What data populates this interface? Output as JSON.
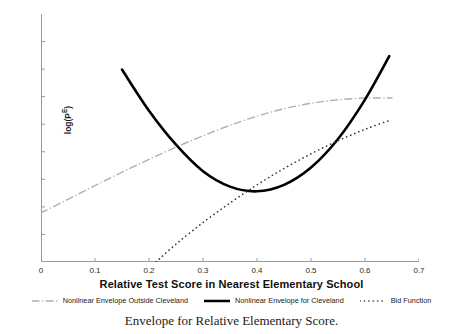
{
  "chart_data": {
    "type": "line",
    "title": "",
    "caption": "Envelope for Relative Elementary Score.",
    "xlabel": "Relative Test Score in Nearest Elementary School",
    "ylabel": "log(P",
    "ylabel_sup": "E",
    "ylabel_close": ")",
    "xlim": [
      0,
      0.7
    ],
    "ylim": [
      0,
      1
    ],
    "grid": false,
    "legend_position": "bottom",
    "xticks": [
      "0",
      "0.1",
      "0.2",
      "0.3",
      "0.4",
      "0.5",
      "0.6",
      "0.7"
    ],
    "xtick_values": [
      0,
      0.1,
      0.2,
      0.3,
      0.4,
      0.5,
      0.6,
      0.7
    ],
    "yticks": [],
    "ytick_count": 8,
    "series": [
      {
        "name": "Nonlinear Envelope Outside Cleveland",
        "style": "dashdot",
        "color": "#b0b0b0",
        "width": 1.4,
        "x": [
          0.0,
          0.05,
          0.1,
          0.15,
          0.2,
          0.25,
          0.3,
          0.35,
          0.4,
          0.45,
          0.5,
          0.55,
          0.6,
          0.65
        ],
        "y": [
          0.198,
          0.253,
          0.308,
          0.362,
          0.414,
          0.463,
          0.509,
          0.551,
          0.588,
          0.618,
          0.64,
          0.654,
          0.661,
          0.661
        ]
      },
      {
        "name": "Nonlinear Envelope for Cleveland",
        "style": "solid",
        "color": "#000000",
        "width": 2.6,
        "x": [
          0.15,
          0.2,
          0.25,
          0.3,
          0.35,
          0.4,
          0.45,
          0.5,
          0.55,
          0.6,
          0.645
        ],
        "y": [
          0.776,
          0.61,
          0.473,
          0.366,
          0.304,
          0.285,
          0.311,
          0.381,
          0.496,
          0.655,
          0.83
        ]
      },
      {
        "name": "Bid Function",
        "style": "dotted",
        "color": "#3a3a3a",
        "width": 1.6,
        "x": [
          0.213,
          0.25,
          0.3,
          0.35,
          0.4,
          0.45,
          0.5,
          0.55,
          0.6,
          0.648
        ],
        "y": [
          0.0,
          0.072,
          0.159,
          0.238,
          0.311,
          0.377,
          0.436,
          0.489,
          0.535,
          0.573
        ]
      }
    ],
    "legend": [
      {
        "label": "Nonlinear Envelope Outside Cleveland",
        "style": "dashdot",
        "color": "#b0b0b0"
      },
      {
        "label": "Nonlinear Envelope for Cleveland",
        "style": "solid",
        "color": "#000000"
      },
      {
        "label": "Bid Function",
        "style": "dotted",
        "color": "#3a3a3a"
      }
    ],
    "axis_color": "#9a9a9a"
  }
}
